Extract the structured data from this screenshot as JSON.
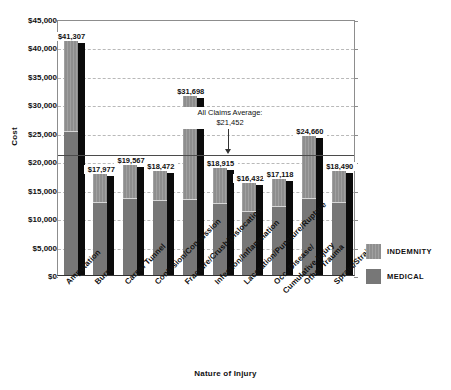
{
  "chart_data": {
    "type": "bar",
    "title": "",
    "xlabel": "Nature of Injury",
    "ylabel": "Cost",
    "ylim": [
      0,
      45000
    ],
    "grid": true,
    "legend_position": "right",
    "categories": [
      "Amputation",
      "Burn",
      "Carpal Tunnel",
      "Contusion/Concussion",
      "Fracture/Crush/Dislocation",
      "Infection/Inflammation",
      "Laceration/Puncture/Rupture",
      "Occ. Disease/\nCumulative Injury",
      "Other Trauma",
      "Sprain/Strain"
    ],
    "ytick_labels": [
      "$45,000",
      "$40,000",
      "$35,000",
      "$30,000",
      "$25,000",
      "$20,000",
      "$15,000",
      "$10,000",
      "$5,000",
      "$0"
    ],
    "ytick_values": [
      45000,
      40000,
      35000,
      30000,
      25000,
      20000,
      15000,
      10000,
      5000,
      0
    ],
    "totals": [
      41307,
      17977,
      19567,
      18472,
      31698,
      18915,
      16432,
      17118,
      24660,
      18490
    ],
    "total_labels": [
      "$41,307",
      "$17,977",
      "$19,567",
      "$18,472",
      "$31,698",
      "$18,915",
      "$16,432",
      "$17,118",
      "$24,660",
      "$18,490"
    ],
    "series": [
      {
        "name": "INDEMNITY",
        "color": "#8e8e8e",
        "values": [
          16000,
          5200,
          6000,
          5300,
          18300,
          6300,
          5100,
          5000,
          11100,
          5600
        ]
      },
      {
        "name": "MEDICAL",
        "color": "#777777",
        "values": [
          25307,
          12777,
          13567,
          13172,
          13398,
          12615,
          11332,
          12118,
          13560,
          12890
        ]
      }
    ],
    "annotation": {
      "line1": "All Claims Average:",
      "line2": "$21,452",
      "value": 21452
    }
  },
  "legend": {
    "items": [
      {
        "label": "INDEMNITY"
      },
      {
        "label": "MEDICAL"
      }
    ]
  }
}
